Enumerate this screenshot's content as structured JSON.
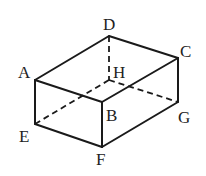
{
  "diagram": {
    "vertices": {
      "A": {
        "label": "A",
        "x": 35,
        "y": 80
      },
      "B": {
        "label": "B",
        "x": 102,
        "y": 102
      },
      "C": {
        "label": "C",
        "x": 178,
        "y": 58
      },
      "D": {
        "label": "D",
        "x": 109,
        "y": 36
      },
      "E": {
        "label": "E",
        "x": 35,
        "y": 124
      },
      "F": {
        "label": "F",
        "x": 102,
        "y": 147
      },
      "G": {
        "label": "G",
        "x": 178,
        "y": 102
      },
      "H": {
        "label": "H",
        "x": 109,
        "y": 80
      }
    },
    "visible_edges": [
      "AB",
      "BC",
      "CD",
      "DA",
      "AE",
      "BF",
      "CG",
      "EF",
      "FG"
    ],
    "hidden_edges": [
      "DH",
      "EH",
      "HG"
    ]
  }
}
